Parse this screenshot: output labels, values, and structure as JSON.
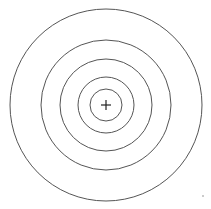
{
  "diagram": {
    "type": "concentric-circles",
    "center": {
      "x": 106,
      "y": 105
    },
    "radii": [
      96,
      65,
      46,
      28,
      16
    ],
    "stroke_color": "#555555",
    "cross": {
      "size": 5,
      "color": "#222222"
    },
    "speck": {
      "x": 203,
      "y": 196,
      "color": "#888888"
    }
  }
}
